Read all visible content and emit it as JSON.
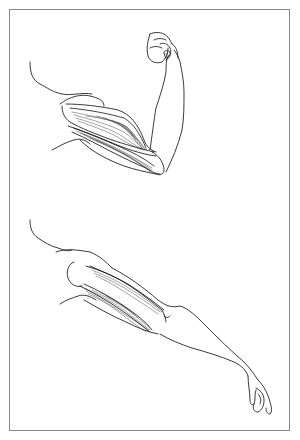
{
  "figure": {
    "border_color": "#8a8a8a",
    "line_color": "#222222",
    "background": "#ffffff",
    "panels": [
      {
        "id": "flexed-arm",
        "description": "Arm flexed at the elbow with clenched fist; biceps contracted and bulging, triceps lengthened"
      },
      {
        "id": "extended-arm",
        "description": "Arm extended downward with open relaxed hand; triceps contracted, biceps lengthened"
      }
    ]
  }
}
